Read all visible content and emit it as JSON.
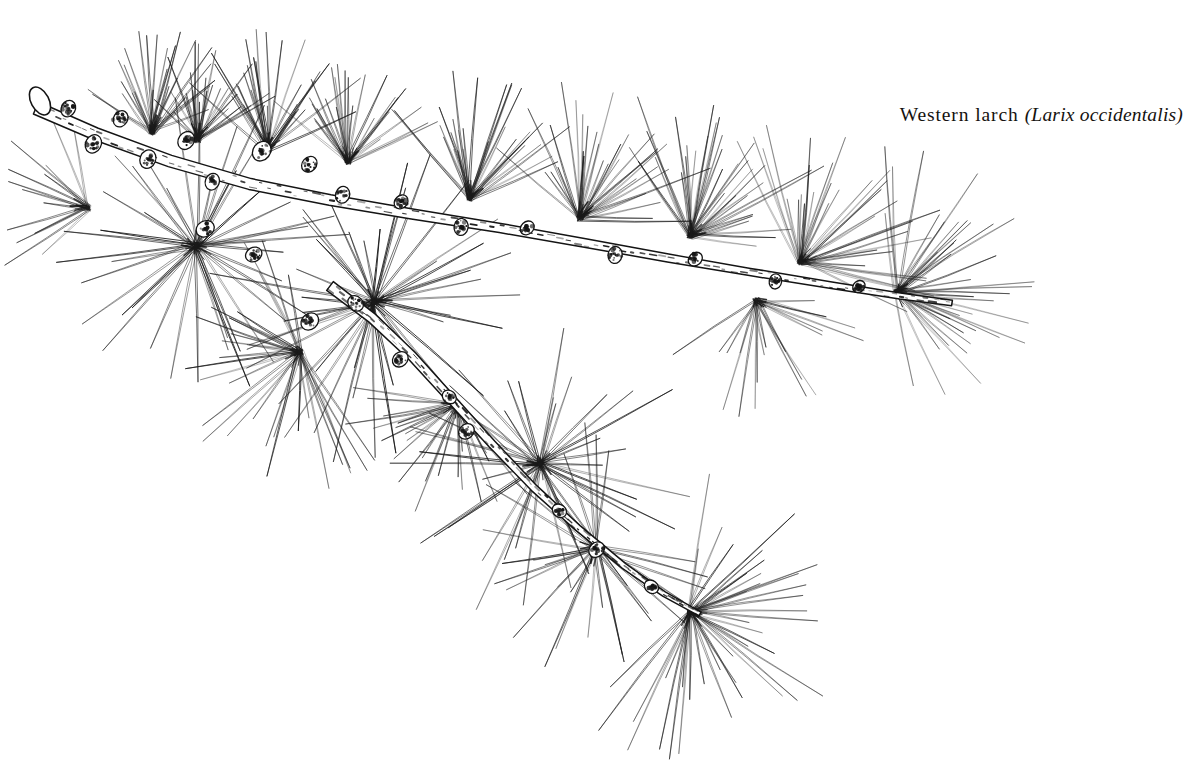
{
  "plate": {
    "width": 1186,
    "height": 784,
    "background_color": "#ffffff",
    "ink_color": "#1a1a1a",
    "medium": "pen-and-ink line drawing",
    "subject": "conifer branch with needle rosettes on short spur shoots"
  },
  "caption": {
    "common_name": "Western larch",
    "scientific_name": "(Larix occidentalis)",
    "full_text": "Western larch (Larix occidentalis)",
    "color": "#15120f"
  },
  "drawing": {
    "stroke_color": "#1a1a1a",
    "needle_width": 0.8,
    "stem_color": "#141414",
    "cut_end": {
      "cx": 40,
      "cy": 101,
      "rx": 9,
      "ry": 15,
      "rotation": -28
    },
    "stems": [
      {
        "name": "main-branch",
        "width": 13,
        "taper": 0.42,
        "points": [
          [
            36,
            108
          ],
          [
            96,
            134
          ],
          [
            170,
            161
          ],
          [
            250,
            184
          ],
          [
            330,
            200
          ],
          [
            412,
            214
          ],
          [
            500,
            228
          ],
          [
            585,
            243
          ],
          [
            668,
            258
          ],
          [
            750,
            272
          ],
          [
            830,
            285
          ],
          [
            900,
            296
          ],
          [
            952,
            303
          ]
        ]
      },
      {
        "name": "lower-branch",
        "width": 11,
        "taper": 0.38,
        "points": [
          [
            330,
            286
          ],
          [
            372,
            318
          ],
          [
            412,
            356
          ],
          [
            452,
            400
          ],
          [
            492,
            444
          ],
          [
            534,
            488
          ],
          [
            578,
            528
          ],
          [
            624,
            566
          ],
          [
            664,
            594
          ],
          [
            700,
            614
          ]
        ]
      }
    ],
    "spur_shoots": [
      {
        "x": 66,
        "y": 113,
        "r": 9,
        "angle": -62
      },
      {
        "x": 96,
        "y": 139,
        "r": 10,
        "angle": 118
      },
      {
        "x": 118,
        "y": 123,
        "r": 9,
        "angle": -58
      },
      {
        "x": 150,
        "y": 154,
        "r": 10,
        "angle": 112
      },
      {
        "x": 183,
        "y": 145,
        "r": 10,
        "angle": -55
      },
      {
        "x": 214,
        "y": 177,
        "r": 9,
        "angle": 110
      },
      {
        "x": 258,
        "y": 156,
        "r": 11,
        "angle": -52
      },
      {
        "x": 306,
        "y": 168,
        "r": 9,
        "angle": -48
      },
      {
        "x": 344,
        "y": 190,
        "r": 9,
        "angle": 106
      },
      {
        "x": 398,
        "y": 205,
        "r": 8,
        "angle": -45
      },
      {
        "x": 462,
        "y": 222,
        "r": 9,
        "angle": 100
      },
      {
        "x": 524,
        "y": 231,
        "r": 8,
        "angle": -44
      },
      {
        "x": 616,
        "y": 250,
        "r": 9,
        "angle": 100
      },
      {
        "x": 692,
        "y": 262,
        "r": 8,
        "angle": -42
      },
      {
        "x": 776,
        "y": 277,
        "r": 8,
        "angle": 98
      },
      {
        "x": 856,
        "y": 289,
        "r": 7,
        "angle": -40
      },
      {
        "x": 210,
        "y": 226,
        "r": 10,
        "angle": 150
      },
      {
        "x": 258,
        "y": 252,
        "r": 9,
        "angle": 150
      },
      {
        "x": 314,
        "y": 318,
        "r": 10,
        "angle": 140
      },
      {
        "x": 352,
        "y": 300,
        "r": 9,
        "angle": 44
      },
      {
        "x": 404,
        "y": 356,
        "r": 9,
        "angle": 138
      },
      {
        "x": 446,
        "y": 394,
        "r": 8,
        "angle": 42
      },
      {
        "x": 470,
        "y": 428,
        "r": 9,
        "angle": 136
      },
      {
        "x": 556,
        "y": 508,
        "r": 8,
        "angle": 40
      },
      {
        "x": 600,
        "y": 546,
        "r": 9,
        "angle": 134
      },
      {
        "x": 648,
        "y": 584,
        "r": 8,
        "angle": 40
      }
    ],
    "needle_clusters": [
      {
        "name": "tuft-upper-1",
        "x": 152,
        "y": 132,
        "count": 26,
        "length": 88,
        "spread": 92,
        "direction": -86,
        "curve": 0.3,
        "weight": 0.9
      },
      {
        "name": "tuft-upper-2",
        "x": 198,
        "y": 140,
        "count": 24,
        "length": 80,
        "spread": 88,
        "direction": -80,
        "curve": 0.28,
        "weight": 0.85
      },
      {
        "name": "tuft-upper-3",
        "x": 268,
        "y": 150,
        "count": 28,
        "length": 96,
        "spread": 95,
        "direction": -84,
        "curve": 0.3,
        "weight": 0.9
      },
      {
        "name": "tuft-upper-4",
        "x": 348,
        "y": 162,
        "count": 26,
        "length": 86,
        "spread": 90,
        "direction": -82,
        "curve": 0.26,
        "weight": 0.85
      },
      {
        "name": "tuft-upper-5",
        "x": 470,
        "y": 198,
        "count": 30,
        "length": 102,
        "spread": 100,
        "direction": -78,
        "curve": 0.3,
        "weight": 0.85
      },
      {
        "name": "tuft-upper-6",
        "x": 580,
        "y": 218,
        "count": 32,
        "length": 112,
        "spread": 108,
        "direction": -72,
        "curve": 0.32,
        "weight": 0.8
      },
      {
        "name": "tuft-upper-7",
        "x": 690,
        "y": 236,
        "count": 34,
        "length": 118,
        "spread": 112,
        "direction": -66,
        "curve": 0.34,
        "weight": 0.78
      },
      {
        "name": "tuft-right-1",
        "x": 800,
        "y": 262,
        "count": 34,
        "length": 116,
        "spread": 120,
        "direction": -48,
        "curve": 0.36,
        "weight": 0.75
      },
      {
        "name": "tuft-right-tip",
        "x": 896,
        "y": 292,
        "count": 38,
        "length": 118,
        "spread": 150,
        "direction": -8,
        "curve": 0.38,
        "weight": 0.7
      },
      {
        "name": "rosette-left-large",
        "x": 196,
        "y": 246,
        "count": 40,
        "length": 130,
        "spread": 358,
        "direction": 180,
        "curve": 0.18,
        "weight": 1.0
      },
      {
        "name": "rosette-mid-large",
        "x": 374,
        "y": 302,
        "count": 42,
        "length": 136,
        "spread": 358,
        "direction": 180,
        "curve": 0.18,
        "weight": 1.0
      },
      {
        "name": "rosette-lower-1",
        "x": 300,
        "y": 352,
        "count": 30,
        "length": 116,
        "spread": 200,
        "direction": 150,
        "curve": 0.2,
        "weight": 0.9
      },
      {
        "name": "tuft-branch-mid",
        "x": 458,
        "y": 404,
        "count": 26,
        "length": 96,
        "spread": 150,
        "direction": 120,
        "curve": 0.26,
        "weight": 0.85
      },
      {
        "name": "rosette-lower-2",
        "x": 540,
        "y": 464,
        "count": 40,
        "length": 132,
        "spread": 350,
        "direction": 170,
        "curve": 0.2,
        "weight": 0.95
      },
      {
        "name": "tuft-lower-3",
        "x": 596,
        "y": 548,
        "count": 30,
        "length": 104,
        "spread": 250,
        "direction": 140,
        "curve": 0.24,
        "weight": 0.88
      },
      {
        "name": "tuft-lower-tip",
        "x": 690,
        "y": 612,
        "count": 40,
        "length": 124,
        "spread": 200,
        "direction": 30,
        "curve": 0.3,
        "weight": 0.8
      },
      {
        "name": "tuft-stray-left",
        "x": 88,
        "y": 208,
        "count": 14,
        "length": 84,
        "spread": 110,
        "direction": 196,
        "curve": 0.24,
        "weight": 0.8
      },
      {
        "name": "tuft-stray-right",
        "x": 756,
        "y": 300,
        "count": 20,
        "length": 96,
        "spread": 130,
        "direction": 62,
        "curve": 0.3,
        "weight": 0.72
      }
    ]
  }
}
